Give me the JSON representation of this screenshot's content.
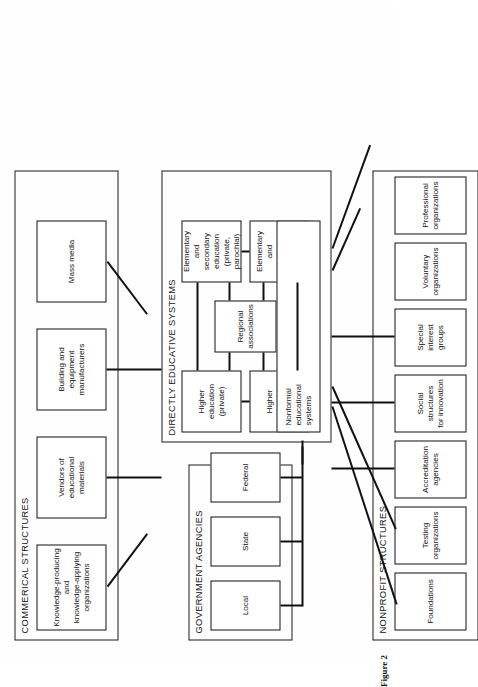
{
  "figure": {
    "caption": "Figure 2",
    "orientation": "rotated-90-ccw"
  },
  "panels": {
    "commercial": {
      "title": "COMMERICAL STRUCTURES",
      "nodes": [
        {
          "id": "knowledge-orgs",
          "label": "Knowledge-producing\nand\nknowledge-applying\norganizations"
        },
        {
          "id": "vendors",
          "label": "Vendors of\neducational\nmaterials"
        },
        {
          "id": "building-equipment",
          "label": "Building and\nequipment\nmanufacturers"
        },
        {
          "id": "mass-media",
          "label": "Mass media"
        }
      ]
    },
    "government": {
      "title": "GOVERNMENT AGENCIES",
      "nodes": [
        {
          "id": "local",
          "label": "Local"
        },
        {
          "id": "state",
          "label": "State"
        },
        {
          "id": "federal",
          "label": "Federal"
        }
      ]
    },
    "educative": {
      "title": "DIRECTLY EDUCATIVE SYSTEMS",
      "nodes": [
        {
          "id": "higher-private",
          "label": "Higher\neducation\n(private)"
        },
        {
          "id": "higher-public",
          "label": "Higher\neducation\n(public)"
        },
        {
          "id": "regional-associations",
          "label": "Regional\nassociations"
        },
        {
          "id": "elem-sec-private",
          "label": "Elementary\nand\nsecondary\neducation\n(private,\nparochial)"
        },
        {
          "id": "elem-sec-public",
          "label": "Elementary\nand\nsecondary\neducation\n(public)"
        },
        {
          "id": "nonformal",
          "label": "Nonformal\neducational\nsystems"
        }
      ]
    },
    "nonprofit": {
      "title": "NONPROFIT STRUCTURES",
      "nodes": [
        {
          "id": "foundations",
          "label": "Foundations"
        },
        {
          "id": "testing-organizations",
          "label": "Testing organizations"
        },
        {
          "id": "accreditation-agencies",
          "label": "Accreditation agencies"
        },
        {
          "id": "social-structures",
          "label": "Social structures\nfor innovation"
        },
        {
          "id": "special-interest",
          "label": "Special interest groups"
        },
        {
          "id": "voluntary-organizations",
          "label": "Voluntary organizations"
        },
        {
          "id": "professional-organizations",
          "label": "Professional\norganizations"
        }
      ]
    }
  },
  "colors": {
    "line": "#111111",
    "background": "#fefefe",
    "text": "#111111"
  }
}
